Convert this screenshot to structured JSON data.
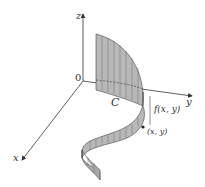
{
  "diagram": {
    "type": "3d-line-integral-curtain",
    "axes": {
      "x": "x",
      "y": "y",
      "z": "z",
      "origin": "0"
    },
    "curve_label": "C",
    "height_label": "f(x, y)",
    "point_label": "(x, y)",
    "colors": {
      "surface_fill": "#b8b8b8",
      "surface_stroke": "#444444",
      "axis": "#333333",
      "background": "#ffffff"
    }
  }
}
